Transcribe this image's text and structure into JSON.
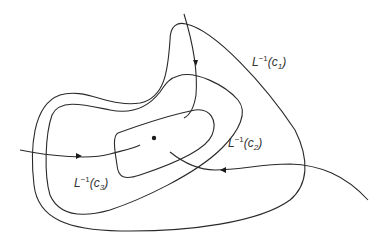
{
  "diagram": {
    "labels": [
      {
        "id": "c1",
        "base": "L",
        "sup": "−1",
        "arg": "c",
        "sub": "1"
      },
      {
        "id": "c2",
        "base": "L",
        "sup": "−1",
        "arg": "c",
        "sub": "2"
      },
      {
        "id": "c3",
        "base": "L",
        "sup": "−1",
        "arg": "c",
        "sub": "3"
      }
    ],
    "colors": {
      "stroke": "#2a2a2a",
      "background": "#ffffff"
    }
  }
}
